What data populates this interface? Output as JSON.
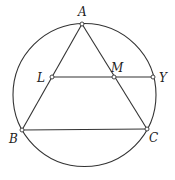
{
  "diagram": {
    "type": "geometry",
    "circle": {
      "cx": 84.5,
      "cy": 95,
      "r": 71.5
    },
    "points": {
      "A": {
        "x": 82,
        "y": 24,
        "label": "A",
        "lx": 78,
        "ly": 16
      },
      "L": {
        "x": 52,
        "y": 77,
        "label": "L",
        "lx": 37,
        "ly": 82
      },
      "M": {
        "x": 114,
        "y": 77,
        "label": "M",
        "lx": 111,
        "ly": 72
      },
      "Y": {
        "x": 153,
        "y": 77,
        "label": "Y",
        "lx": 159,
        "ly": 82
      },
      "B": {
        "x": 22,
        "y": 130,
        "label": "B",
        "lx": 9,
        "ly": 143
      },
      "C": {
        "x": 147,
        "y": 129,
        "label": "C",
        "lx": 149,
        "ly": 142
      }
    },
    "segments": [
      [
        "A",
        "B"
      ],
      [
        "A",
        "C"
      ],
      [
        "B",
        "C"
      ],
      [
        "L",
        "Y"
      ]
    ],
    "colors": {
      "line": "#333333",
      "label": "#222222",
      "background": "#ffffff"
    }
  }
}
